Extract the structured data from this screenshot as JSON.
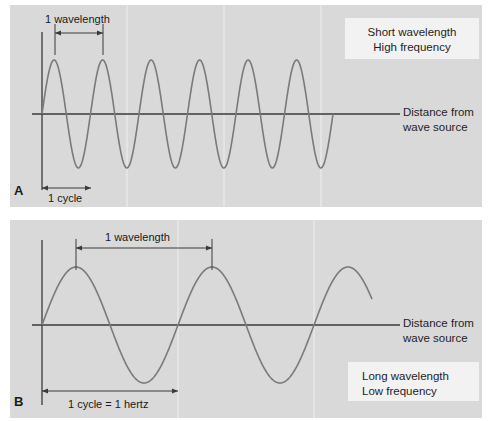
{
  "figure": {
    "background_color": "#ffffff",
    "panel_color": "#d9d9d9",
    "wave_color": "#7a7a7a",
    "axis_color": "#3a3a3a",
    "gridline_color": "#e8e8e8",
    "callout_color": "#f2f2f2"
  },
  "panel_a": {
    "letter": "A",
    "callout_line1": "Short wavelength",
    "callout_line2": "High frequency",
    "axis_label_line1": "Distance from",
    "axis_label_line2": "wave source",
    "wavelength_label": "1 wavelength",
    "cycle_label": "1 cycle"
  },
  "panel_b": {
    "letter": "B",
    "callout_line1": "Long wavelength",
    "callout_line2": "Low frequency",
    "axis_label_line1": "Distance from",
    "axis_label_line2": "wave source",
    "wavelength_label": "1 wavelength",
    "cycle_label": "1 cycle = 1 hertz"
  },
  "chart_data": {
    "type": "line",
    "charts": [
      {
        "id": "panel-a",
        "label": "A",
        "description": "Short wavelength, high frequency sine wave",
        "xlabel": "Distance from wave source",
        "ylabel": "",
        "baseline_y": 114,
        "origin_x": 42,
        "wave_start_x": 42,
        "wave_end_x": 333,
        "amplitude_px": 54,
        "wavelength_px": 48.5,
        "cycles": 6,
        "peaks_x": [
          55,
          103,
          152,
          200,
          249,
          297
        ],
        "troughs_x": [
          79,
          128,
          176,
          225,
          273,
          321
        ],
        "gridlines_x": [
          127,
          224,
          321
        ],
        "dimension_wavelength": {
          "from_x": 55,
          "to_x": 103,
          "y": 33
        },
        "dimension_cycle": {
          "from_x": 42,
          "to_x": 91,
          "y": 188
        }
      },
      {
        "id": "panel-b",
        "label": "B",
        "description": "Long wavelength, low frequency sine wave",
        "xlabel": "Distance from wave source",
        "ylabel": "",
        "baseline_y": 325,
        "origin_x": 42,
        "wave_start_x": 42,
        "wave_end_x": 372,
        "amplitude_px": 58,
        "wavelength_px": 136,
        "cycles": 2.4,
        "peaks_x": [
          76,
          212,
          348
        ],
        "troughs_x": [
          144,
          280
        ],
        "gridlines_x": [
          178,
          314
        ],
        "dimension_wavelength": {
          "from_x": 76,
          "to_x": 212,
          "y": 248
        },
        "dimension_cycle": {
          "from_x": 42,
          "to_x": 178,
          "y": 391
        }
      }
    ]
  }
}
